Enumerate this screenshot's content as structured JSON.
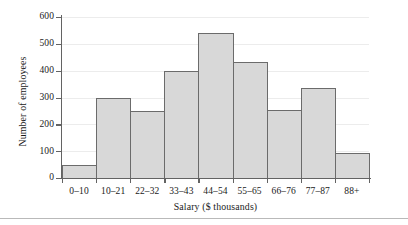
{
  "chart_data": {
    "type": "bar",
    "title": "",
    "subtitle": "",
    "xlabel": "Salary ($ thousands)",
    "ylabel": "Number of employees",
    "categories": [
      "0–10",
      "10–21",
      "22–32",
      "33–43",
      "44–54",
      "55–65",
      "66–76",
      "77–87",
      "88+"
    ],
    "values": [
      48,
      300,
      248,
      397,
      542,
      432,
      255,
      337,
      92
    ],
    "ylim": [
      0,
      600
    ],
    "ytick_values": [
      0,
      100,
      200,
      300,
      400,
      500,
      600
    ],
    "ytick_labels": [
      "0",
      "100",
      "200",
      "300",
      "400",
      "500",
      "600"
    ],
    "grid": true,
    "grid_axis": "y",
    "legend": null,
    "legend_position": "none",
    "annotations": [],
    "bar_fill_color": "#d8d8d8",
    "bar_edge_color": "#6b6b6b",
    "axis_color": "#636363",
    "grid_color": "#ececec",
    "background_color": "#ffffff"
  }
}
